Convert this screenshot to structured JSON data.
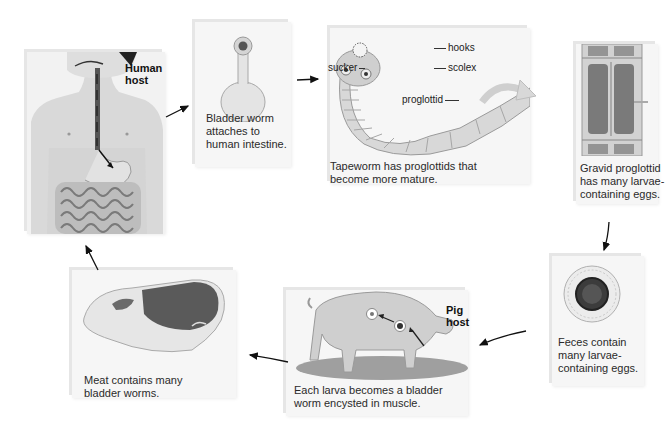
{
  "diagram": {
    "type": "cycle",
    "stages": [
      {
        "id": "human-host",
        "host_label": "Human host",
        "host_label_lines": [
          "Human",
          "host"
        ],
        "caption": ""
      },
      {
        "id": "bladder-worm-attach",
        "caption": "Bladder worm attaches to human intestine.",
        "caption_lines": [
          "Bladder worm",
          "attaches to",
          "human intestine."
        ]
      },
      {
        "id": "tapeworm",
        "caption": "Tapeworm has proglottids that become more mature.",
        "caption_lines": [
          "Tapeworm has proglottids that",
          "become more mature."
        ],
        "parts": {
          "hooks": "hooks",
          "sucker": "sucker",
          "scolex": "scolex",
          "proglottid": "proglottid"
        }
      },
      {
        "id": "gravid-proglottid",
        "caption": "Gravid proglottid has many larvae-containing eggs.",
        "caption_lines": [
          "Gravid proglottid",
          "has many larvae-",
          "containing eggs."
        ]
      },
      {
        "id": "feces-eggs",
        "caption": "Feces contain many larvae-containing eggs.",
        "caption_lines": [
          "Feces contain",
          "many larvae-",
          "containing eggs."
        ]
      },
      {
        "id": "pig-host",
        "host_label": "Pig host",
        "host_label_lines": [
          "Pig",
          "host"
        ],
        "caption": "Each larva becomes a bladder worm encysted in muscle.",
        "caption_lines": [
          "Each larva becomes a bladder",
          "worm encysted in muscle."
        ]
      },
      {
        "id": "meat",
        "caption": "Meat contains many bladder worms.",
        "caption_lines": [
          "Meat contains many",
          "bladder worms."
        ]
      }
    ],
    "flow": [
      [
        "human-host",
        "bladder-worm-attach"
      ],
      [
        "bladder-worm-attach",
        "tapeworm"
      ],
      [
        "tapeworm",
        "gravid-proglottid"
      ],
      [
        "gravid-proglottid",
        "feces-eggs"
      ],
      [
        "feces-eggs",
        "pig-host"
      ],
      [
        "pig-host",
        "meat"
      ],
      [
        "meat",
        "human-host"
      ]
    ]
  }
}
